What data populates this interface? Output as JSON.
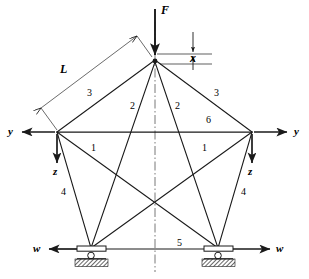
{
  "diagram": {
    "colors": {
      "line": "#1a1a1a",
      "centerline": "#555555",
      "ground_hatch": "#333333",
      "background": "#ffffff"
    },
    "nodes": [
      {
        "id": "apex",
        "x": 155,
        "y": 60,
        "name": "apex-node"
      },
      {
        "id": "left",
        "x": 57,
        "y": 132,
        "name": "left-node"
      },
      {
        "id": "right",
        "x": 252,
        "y": 132,
        "name": "right-node"
      },
      {
        "id": "bottom-left",
        "x": 91,
        "y": 248,
        "name": "bottom-left-support-node"
      },
      {
        "id": "bottom-right",
        "x": 218,
        "y": 248,
        "name": "bottom-right-support-node"
      }
    ],
    "members": [
      {
        "label": "3",
        "from": "left",
        "to": "apex",
        "label_x": 87,
        "label_y": 93
      },
      {
        "label": "3",
        "from": "apex",
        "to": "right",
        "label_x": 215,
        "label_y": 93
      },
      {
        "label": "2",
        "from": "apex",
        "to": "bottom-left",
        "label_x": 131,
        "label_y": 106
      },
      {
        "label": "2",
        "from": "apex",
        "to": "bottom-right",
        "label_x": 176,
        "label_y": 106
      },
      {
        "label": "6",
        "from": "left",
        "to": "right",
        "label_x": 207,
        "label_y": 120
      },
      {
        "label": "1",
        "from": "left",
        "to": "bottom-right",
        "label_x": 92,
        "label_y": 148
      },
      {
        "label": "1",
        "from": "right",
        "to": "bottom-left",
        "label_x": 203,
        "label_y": 148
      },
      {
        "label": "4",
        "from": "left",
        "to": "bottom-left",
        "label_x": 62,
        "label_y": 192
      },
      {
        "label": "4",
        "from": "right",
        "to": "bottom-right",
        "label_x": 242,
        "label_y": 192
      },
      {
        "label": "5",
        "from": "bottom-left",
        "to": "bottom-right",
        "label_x": 178,
        "label_y": 243
      }
    ],
    "load": {
      "symbol": "F",
      "label_x": 161,
      "label_y": 6,
      "arrow_from_y": 8,
      "arrow_to_y": 55,
      "arrow_x": 155
    },
    "displacement": {
      "symbol": "x",
      "label_x": 196,
      "label_y": 39
    },
    "length_dimension": {
      "symbol": "L",
      "label_x": 60,
      "label_y": 63
    },
    "dof_labels": [
      {
        "symbol": "y",
        "x": 8,
        "y": 126,
        "direction": "left",
        "name": "left-node-y-axis"
      },
      {
        "symbol": "z",
        "x": 51,
        "y": 170,
        "direction": "down",
        "name": "left-node-z-axis"
      },
      {
        "symbol": "y",
        "x": 294,
        "y": 126,
        "direction": "right",
        "name": "right-node-y-axis"
      },
      {
        "symbol": "z",
        "x": 246,
        "y": 170,
        "direction": "down",
        "name": "right-node-z-axis"
      },
      {
        "symbol": "w",
        "x": 35,
        "y": 243,
        "direction": "left",
        "name": "left-support-w-axis"
      },
      {
        "symbol": "w",
        "x": 283,
        "y": 243,
        "direction": "right",
        "name": "right-support-w-axis"
      }
    ],
    "supports": [
      {
        "name": "left-roller-support",
        "x": 91,
        "y": 248
      },
      {
        "name": "right-roller-support",
        "x": 218,
        "y": 248
      }
    ],
    "centerline": {
      "x": 155,
      "top": 22,
      "bottom": 272
    }
  }
}
